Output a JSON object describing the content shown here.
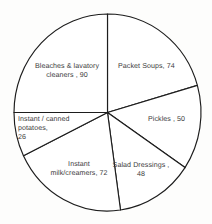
{
  "chart_data": {
    "type": "pie",
    "title": "",
    "subtitle": "",
    "xlabel": "",
    "ylabel": "",
    "legend_position": "none",
    "grid": false,
    "total": 360,
    "start_angle_deg": 0,
    "direction": "clockwise",
    "categories": [
      "Packet Soups",
      "Pickles",
      "Salad Dressings",
      "Instant milk/creamers",
      "Instant / canned potatoes",
      "Bleaches & lavatory cleaners"
    ],
    "values": [
      74,
      50,
      48,
      72,
      26,
      90
    ],
    "slices": [
      {
        "name": "Packet Soups",
        "value": 74,
        "label": "Packet Soups, 74",
        "start_deg": 0,
        "end_deg": 74,
        "color": "#ffffff"
      },
      {
        "name": "Pickles",
        "value": 50,
        "label": "Pickles , 50",
        "start_deg": 74,
        "end_deg": 124,
        "color": "#ffffff"
      },
      {
        "name": "Salad Dressings",
        "value": 48,
        "label": "Salad Dressings ,\n48",
        "start_deg": 124,
        "end_deg": 172,
        "color": "#ffffff"
      },
      {
        "name": "Instant milk/creamers",
        "value": 72,
        "label": "Instant\nmilk/creamers, 72",
        "start_deg": 172,
        "end_deg": 244,
        "color": "#ffffff"
      },
      {
        "name": "Instant / canned potatoes",
        "value": 26,
        "label": "Instant / canned\npotatoes,\n26",
        "start_deg": 244,
        "end_deg": 270,
        "color": "#ffffff"
      },
      {
        "name": "Bleaches & lavatory cleaners",
        "value": 90,
        "label": "Bleaches & lavatory\ncleaners , 90",
        "start_deg": 270,
        "end_deg": 360,
        "color": "#ffffff"
      }
    ],
    "colors": {
      "slice_fill": "#ffffff",
      "slice_outline": "#1d1d1d",
      "label_text": "#3c3c3c",
      "background": "#fdfdfc"
    }
  }
}
